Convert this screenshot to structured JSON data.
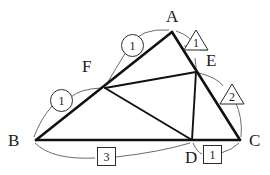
{
  "figure": {
    "type": "geometry-diagram",
    "background_color": "#ffffff",
    "stroke_color": "#1a1a1a",
    "arc_color": "#555555",
    "accent_color": "#3aa76d"
  },
  "vertices": [
    {
      "id": "A",
      "label": "A",
      "x": 172,
      "y": 32,
      "label_x": 166,
      "label_y": 8
    },
    {
      "id": "B",
      "label": "B",
      "x": 36,
      "y": 140,
      "label_x": 8,
      "label_y": 137
    },
    {
      "id": "C",
      "label": "C",
      "x": 240,
      "y": 140,
      "label_x": 249,
      "label_y": 137
    },
    {
      "id": "D",
      "label": "D",
      "x": 192,
      "y": 140,
      "label_x": 185,
      "label_y": 150
    },
    {
      "id": "E",
      "label": "E",
      "x": 196,
      "y": 72,
      "label_x": 206,
      "label_y": 54
    },
    {
      "id": "F",
      "label": "F",
      "x": 105,
      "y": 88,
      "label_x": 82,
      "label_y": 60
    }
  ],
  "segments": [
    {
      "name": "AB",
      "from": "A",
      "to": "B"
    },
    {
      "name": "BC",
      "from": "B",
      "to": "C"
    },
    {
      "name": "AC",
      "from": "A",
      "to": "C"
    },
    {
      "name": "FE",
      "from": "F",
      "to": "E"
    },
    {
      "name": "FD",
      "from": "F",
      "to": "D"
    },
    {
      "name": "ED",
      "from": "E",
      "to": "D"
    }
  ],
  "markers": [
    {
      "id": "marker-af",
      "shape": "circle",
      "value": "1",
      "meaning": "segment AF ratio part",
      "x": 121,
      "y": 34
    },
    {
      "id": "marker-fb",
      "shape": "circle",
      "value": "1",
      "meaning": "segment FB ratio part",
      "x": 50,
      "y": 89
    },
    {
      "id": "marker-ae",
      "shape": "triangle",
      "value": "1",
      "meaning": "segment AE ratio part",
      "x": 183,
      "y": 29
    },
    {
      "id": "marker-ec",
      "shape": "triangle",
      "value": "2",
      "meaning": "segment EC ratio part",
      "x": 219,
      "y": 83
    },
    {
      "id": "marker-bd",
      "shape": "box",
      "value": "3",
      "meaning": "segment BD ratio part",
      "x": 97,
      "y": 147
    },
    {
      "id": "marker-dc",
      "shape": "box",
      "value": "1",
      "meaning": "segment DC ratio part",
      "x": 203,
      "y": 145
    }
  ],
  "ratios": {
    "AF_to_FB": "1 : 1",
    "AE_to_EC": "1 : 2",
    "BD_to_DC": "3 : 1"
  }
}
